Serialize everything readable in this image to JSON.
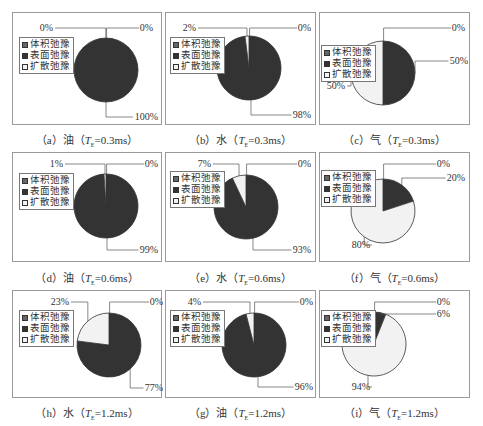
{
  "legend": {
    "items": [
      {
        "label": "体积弛豫",
        "color": "#666666"
      },
      {
        "label": "表面弛豫",
        "color": "#333333"
      },
      {
        "label": "扩散弛豫",
        "color": "#f2f2f2"
      }
    ]
  },
  "captions": [
    {
      "prefix": "（a）油（",
      "t": "T",
      "sub": "E",
      "suffix": "=0.3ms）"
    },
    {
      "prefix": "（b）水（",
      "t": "T",
      "sub": "E",
      "suffix": "=0.3ms）"
    },
    {
      "prefix": "（c）气（",
      "t": "T",
      "sub": "E",
      "suffix": "=0.3ms）"
    },
    {
      "prefix": "（d）油（",
      "t": "T",
      "sub": "E",
      "suffix": "=0.6ms）"
    },
    {
      "prefix": "（e）水（",
      "t": "T",
      "sub": "E",
      "suffix": "=0.6ms）"
    },
    {
      "prefix": "（f）气（",
      "t": "T",
      "sub": "E",
      "suffix": "=0.6ms）"
    },
    {
      "prefix": "（h）水（",
      "t": "T",
      "sub": "E",
      "suffix": "=1.2ms）"
    },
    {
      "prefix": "（g）油（",
      "t": "T",
      "sub": "E",
      "suffix": "=1.2ms）"
    },
    {
      "prefix": "（i）气（",
      "t": "T",
      "sub": "E",
      "suffix": "=1.2ms）"
    }
  ],
  "chart_data": [
    {
      "type": "pie",
      "title": "(a) 油 (TE=0.3ms)",
      "categories": [
        "体积弛豫",
        "表面弛豫",
        "扩散弛豫"
      ],
      "values": [
        0,
        100,
        0
      ],
      "labels": [
        "0%",
        "100%",
        "0%"
      ]
    },
    {
      "type": "pie",
      "title": "(b) 水 (TE=0.3ms)",
      "categories": [
        "体积弛豫",
        "表面弛豫",
        "扩散弛豫"
      ],
      "values": [
        0,
        98,
        2
      ],
      "labels": [
        "0%",
        "98%",
        "2%"
      ]
    },
    {
      "type": "pie",
      "title": "(c) 气 (TE=0.3ms)",
      "categories": [
        "体积弛豫",
        "表面弛豫",
        "扩散弛豫"
      ],
      "values": [
        0,
        50,
        50
      ],
      "labels": [
        "0%",
        "50%",
        "50%"
      ]
    },
    {
      "type": "pie",
      "title": "(d) 油 (TE=0.6ms)",
      "categories": [
        "体积弛豫",
        "表面弛豫",
        "扩散弛豫"
      ],
      "values": [
        0,
        99,
        1
      ],
      "labels": [
        "0%",
        "99%",
        "1%"
      ]
    },
    {
      "type": "pie",
      "title": "(e) 水 (TE=0.6ms)",
      "categories": [
        "体积弛豫",
        "表面弛豫",
        "扩散弛豫"
      ],
      "values": [
        0,
        93,
        7
      ],
      "labels": [
        "0%",
        "93%",
        "7%"
      ]
    },
    {
      "type": "pie",
      "title": "(f) 气 (TE=0.6ms)",
      "categories": [
        "体积弛豫",
        "表面弛豫",
        "扩散弛豫"
      ],
      "values": [
        0,
        20,
        80
      ],
      "labels": [
        "0%",
        "20%",
        "80%"
      ]
    },
    {
      "type": "pie",
      "title": "(h) 水 (TE=1.2ms)",
      "categories": [
        "体积弛豫",
        "表面弛豫",
        "扩散弛豫"
      ],
      "values": [
        0,
        77,
        23
      ],
      "labels": [
        "0%",
        "77%",
        "23%"
      ]
    },
    {
      "type": "pie",
      "title": "(g) 油 (TE=1.2ms)",
      "categories": [
        "体积弛豫",
        "表面弛豫",
        "扩散弛豫"
      ],
      "values": [
        0,
        96,
        4
      ],
      "labels": [
        "0%",
        "96%",
        "4%"
      ]
    },
    {
      "type": "pie",
      "title": "(i) 气 (TE=1.2ms)",
      "categories": [
        "体积弛豫",
        "表面弛豫",
        "扩散弛豫"
      ],
      "values": [
        0,
        6,
        94
      ],
      "labels": [
        "0%",
        "6%",
        "94%"
      ]
    }
  ]
}
